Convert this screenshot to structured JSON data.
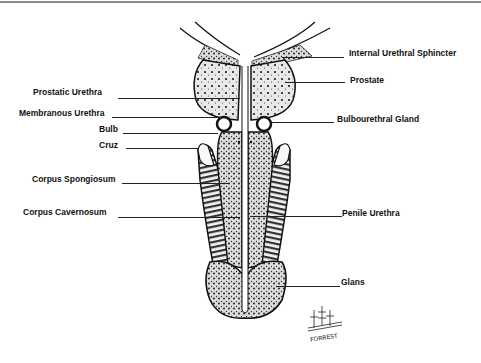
{
  "diagram": {
    "labels_left": [
      {
        "id": "prostatic-urethra",
        "text": "Prostatic Urethra"
      },
      {
        "id": "membranous-urethra",
        "text": "Membranous Urethra"
      },
      {
        "id": "bulb",
        "text": "Bulb"
      },
      {
        "id": "cruz",
        "text": "Cruz"
      },
      {
        "id": "corpus-spongiosum",
        "text": "Corpus Spongiosum"
      },
      {
        "id": "corpus-cavernosum",
        "text": "Corpus Cavernosum"
      }
    ],
    "labels_right": [
      {
        "id": "internal-urethral-sphincter",
        "text": "Internal Urethral Sphincter"
      },
      {
        "id": "prostate",
        "text": "Prostate"
      },
      {
        "id": "bulbourethral-gland",
        "text": "Bulbourethral Gland"
      },
      {
        "id": "penile-urethra",
        "text": "Penile Urethra"
      },
      {
        "id": "glans",
        "text": "Glans"
      }
    ],
    "signature": "FORREST"
  }
}
